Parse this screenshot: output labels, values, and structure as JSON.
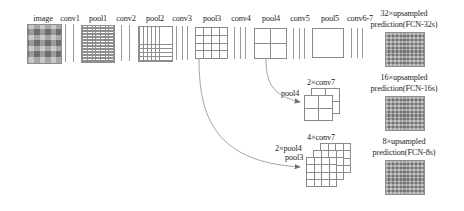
{
  "figure": {
    "type": "neural-network-architecture-diagram"
  },
  "backbone": {
    "labels": [
      {
        "id": "image",
        "text": "image",
        "x": 43,
        "kind": "texture-square"
      },
      {
        "id": "conv1",
        "text": "conv1",
        "x": 70,
        "kind": "bars",
        "bars": 2
      },
      {
        "id": "pool1",
        "text": "pool1",
        "x": 98,
        "kind": "fine-grid"
      },
      {
        "id": "conv2",
        "text": "conv2",
        "x": 126,
        "kind": "bars",
        "bars": 2
      },
      {
        "id": "pool2",
        "text": "pool2",
        "x": 155,
        "kind": "fine-grid"
      },
      {
        "id": "conv3",
        "text": "conv3",
        "x": 182,
        "kind": "bars",
        "bars": 3
      },
      {
        "id": "pool3",
        "text": "pool3",
        "x": 212,
        "kind": "cell-grid",
        "cells": "4x4"
      },
      {
        "id": "conv4",
        "text": "conv4",
        "x": 241,
        "kind": "bars",
        "bars": 3
      },
      {
        "id": "pool4",
        "text": "pool4",
        "x": 271,
        "kind": "cell-grid",
        "cells": "2x2"
      },
      {
        "id": "conv5",
        "text": "conv5",
        "x": 300,
        "kind": "bars",
        "bars": 3
      },
      {
        "id": "pool5",
        "text": "pool5",
        "x": 330,
        "kind": "plain-square"
      },
      {
        "id": "conv6-7",
        "text": "conv6-7",
        "x": 360,
        "kind": "bars",
        "bars": 3
      }
    ]
  },
  "predictions": [
    {
      "id": "fcn32s",
      "line1": "32×upsampled",
      "line2": "prediction(FCN-32s)"
    },
    {
      "id": "fcn16s",
      "line1": "16×upsampled",
      "line2": "prediction(FCN-16s)"
    },
    {
      "id": "fcn8s",
      "line1": "8×upsampled",
      "line2": "prediction(FCN-8s)"
    }
  ],
  "fusion": {
    "stack16s": {
      "top_label": "2×conv7",
      "side_label": "pool4",
      "layers": 2,
      "cells": "2x2"
    },
    "stack8s": {
      "top_label": "4×conv7",
      "mid_label": "2×pool4",
      "side_label": "pool3",
      "layers": 3,
      "cells": "4x4"
    }
  },
  "colors": {
    "stroke": "#8a8a8a",
    "text": "#1d1d1d",
    "texture": "#8f8f8f",
    "background": "#ffffff"
  }
}
